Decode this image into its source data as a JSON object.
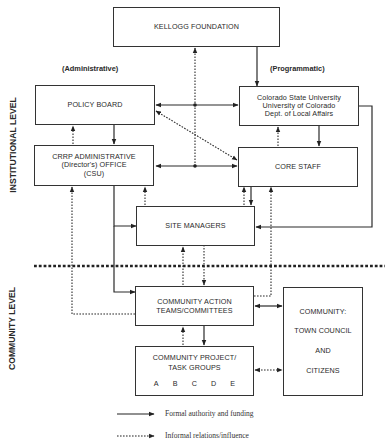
{
  "diagram": {
    "level_labels": {
      "institutional": "INSTITUTIONAL LEVEL",
      "community": "COMMUNITY LEVEL"
    },
    "column_labels": {
      "administrative": "(Administrative)",
      "programmatic": "(Programmatic)"
    },
    "nodes": {
      "kellogg": {
        "lines": [
          "KELLOGG FOUNDATION"
        ]
      },
      "policy_board": {
        "lines": [
          "POLICY BOARD"
        ]
      },
      "universities": {
        "lines": [
          "Colorado State University",
          "University of Colorado",
          "Dept. of Local Affairs"
        ]
      },
      "crrp_office": {
        "lines": [
          "CRRP ADMINISTRATIVE",
          "(Director's) OFFICE",
          "(CSU)"
        ]
      },
      "core_staff": {
        "lines": [
          "CORE STAFF"
        ]
      },
      "site_managers": {
        "lines": [
          "SITE MANAGERS"
        ]
      },
      "action_teams": {
        "lines": [
          "COMMUNITY ACTION",
          "TEAMS/COMMITTEES"
        ]
      },
      "task_groups": {
        "lines": [
          "COMMUNITY PROJECT/",
          "TASK GROUPS"
        ],
        "groups": [
          "A",
          "B",
          "C",
          "D",
          "E"
        ]
      },
      "community": {
        "lines": [
          "COMMUNITY:",
          "TOWN COUNCIL",
          "AND",
          "CITIZENS"
        ]
      }
    },
    "edges": [
      {
        "from": "kellogg",
        "to": "universities",
        "type": "formal"
      },
      {
        "from": "policy_board",
        "to": "crrp_office",
        "type": "formal"
      },
      {
        "from": "policy_board",
        "to": "universities",
        "type": "formal",
        "bidirectional": true
      },
      {
        "from": "universities",
        "to": "core_staff",
        "type": "formal"
      },
      {
        "from": "crrp_office",
        "to": "core_staff",
        "type": "formal",
        "bidirectional": true
      },
      {
        "from": "crrp_office",
        "to": "site_managers",
        "type": "formal"
      },
      {
        "from": "crrp_office",
        "to": "action_teams",
        "type": "formal"
      },
      {
        "from": "core_staff",
        "to": "site_managers",
        "type": "formal"
      },
      {
        "from": "universities",
        "to": "site_managers",
        "type": "formal"
      },
      {
        "from": "action_teams",
        "to": "task_groups",
        "type": "formal"
      },
      {
        "from": "action_teams",
        "to": "community",
        "type": "formal",
        "bidirectional": true
      },
      {
        "from": "center_junction",
        "to": "kellogg",
        "type": "informal"
      },
      {
        "from": "crrp_office",
        "to": "policy_board",
        "type": "informal"
      },
      {
        "from": "core_staff",
        "to": "universities",
        "type": "informal"
      },
      {
        "from": "policy_board",
        "to": "core_staff",
        "type": "informal",
        "bidirectional": true
      },
      {
        "from": "site_managers",
        "to": "crrp_office",
        "type": "informal"
      },
      {
        "from": "site_managers",
        "to": "core_staff",
        "type": "informal"
      },
      {
        "from": "action_teams",
        "to": "crrp_office",
        "type": "informal"
      },
      {
        "from": "action_teams",
        "to": "core_staff",
        "type": "informal"
      },
      {
        "from": "site_managers",
        "to": "action_teams",
        "type": "informal",
        "bidirectional": true
      },
      {
        "from": "task_groups",
        "to": "action_teams",
        "type": "informal"
      },
      {
        "from": "task_groups",
        "to": "community",
        "type": "informal",
        "bidirectional": true
      }
    ],
    "legend": [
      {
        "type": "formal",
        "label": "Formal authority and funding"
      },
      {
        "type": "informal",
        "label": "Informal relations/influence"
      }
    ]
  }
}
